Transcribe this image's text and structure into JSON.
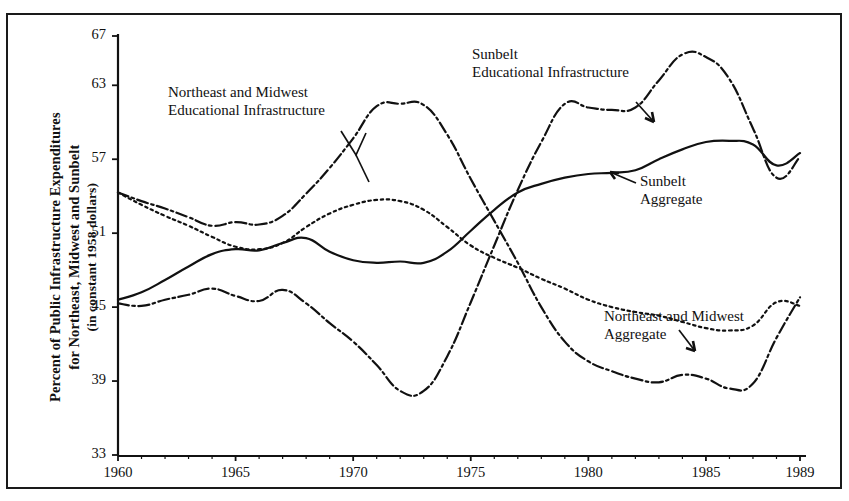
{
  "figure": {
    "ylabel_line1": "Percent of Public Infrastructure Expenditures",
    "ylabel_line2": "for Northeast, Midwest and Sunbelt",
    "ylabel_line3": "(in constant 1958 dollars)",
    "ink_color": "#111111",
    "background": "#ffffff"
  },
  "annotations": [
    {
      "id": "ne-mw-edu",
      "line1": "Northeast and Midwest",
      "line2": "Educational Infrastructure"
    },
    {
      "id": "sunbelt-edu",
      "line1": "Sunbelt",
      "line2": "Educational Infrastructure"
    },
    {
      "id": "sunbelt-agg",
      "line1": "Sunbelt",
      "line2": "Aggregate"
    },
    {
      "id": "ne-mw-agg",
      "line1": "Northeast and Midwest",
      "line2": "Aggregate"
    }
  ],
  "chart_data": {
    "type": "line",
    "title": "",
    "xlabel": "",
    "ylabel": "Percent of Public Infrastructure Expenditures for Northeast, Midwest and Sunbelt (in constant 1958 dollars)",
    "xlim": [
      1960,
      1989
    ],
    "ylim": [
      33,
      67
    ],
    "ytick_labels": [
      "67",
      "63",
      "57",
      "51",
      "45",
      "39",
      "33"
    ],
    "ytick_values": [
      67,
      63,
      57,
      51,
      45,
      39,
      33
    ],
    "xtick_labels": [
      "1960",
      "1965",
      "1970",
      "1975",
      "1980",
      "1985",
      "1989"
    ],
    "xtick_values": [
      1960,
      1965,
      1970,
      1975,
      1980,
      1985,
      1989
    ],
    "grid": false,
    "legend": "inline-annotations",
    "x": [
      1960,
      1961,
      1962,
      1963,
      1964,
      1965,
      1966,
      1967,
      1968,
      1969,
      1970,
      1971,
      1972,
      1973,
      1974,
      1975,
      1976,
      1977,
      1978,
      1979,
      1980,
      1981,
      1982,
      1983,
      1984,
      1985,
      1986,
      1987,
      1988,
      1989
    ],
    "series": [
      {
        "name": "Northeast and Midwest Educational Infrastructure",
        "style": "dash-dot",
        "values": [
          54.3,
          53.6,
          53.0,
          52.3,
          51.6,
          51.9,
          51.7,
          52.4,
          54.2,
          56.3,
          58.7,
          61.3,
          61.5,
          61.4,
          59.0,
          55.4,
          52.0,
          48.6,
          45.0,
          42.2,
          40.6,
          39.8,
          39.2,
          38.9,
          39.5,
          39.2,
          38.4,
          38.8,
          42.5,
          45.8
        ]
      },
      {
        "name": "Northeast and Midwest Aggregate",
        "style": "dotted",
        "values": [
          54.3,
          53.3,
          52.4,
          51.6,
          50.7,
          49.9,
          49.7,
          50.2,
          51.5,
          52.6,
          53.3,
          53.7,
          53.6,
          52.9,
          51.5,
          50.0,
          49.0,
          48.2,
          47.3,
          46.5,
          45.6,
          45.0,
          44.6,
          44.3,
          43.8,
          43.3,
          43.1,
          43.5,
          45.4,
          45.1
        ]
      },
      {
        "name": "Sunbelt Aggregate",
        "style": "solid",
        "values": [
          45.6,
          46.2,
          47.2,
          48.3,
          49.3,
          49.7,
          49.6,
          50.2,
          50.6,
          49.5,
          48.8,
          48.6,
          48.7,
          48.6,
          49.5,
          51.2,
          52.9,
          54.3,
          55.0,
          55.5,
          55.8,
          55.9,
          56.1,
          57.0,
          57.8,
          58.4,
          58.5,
          58.2,
          56.5,
          57.5
        ]
      },
      {
        "name": "Sunbelt Educational Infrastructure",
        "style": "dash-dot",
        "values": [
          45.3,
          45.1,
          45.6,
          46.0,
          46.5,
          45.9,
          45.5,
          46.4,
          45.3,
          43.7,
          42.2,
          40.3,
          38.2,
          38.2,
          41.0,
          45.4,
          50.0,
          54.5,
          58.4,
          61.5,
          61.2,
          61.0,
          61.2,
          63.4,
          65.5,
          65.3,
          63.5,
          59.5,
          55.5,
          57.2
        ]
      }
    ]
  }
}
